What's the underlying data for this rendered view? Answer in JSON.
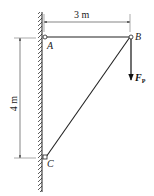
{
  "diagram": {
    "type": "truss-bracket",
    "points": {
      "A": {
        "label": "A"
      },
      "B": {
        "label": "B"
      },
      "C": {
        "label": "C"
      }
    },
    "dimensions": {
      "horizontal": "3 m",
      "vertical": "4 m"
    },
    "force": {
      "label": "F",
      "subscript": "P",
      "direction": "down",
      "applied_at": "B"
    },
    "members": [
      {
        "from": "A",
        "to": "B"
      },
      {
        "from": "B",
        "to": "C"
      }
    ],
    "support": "wall"
  }
}
